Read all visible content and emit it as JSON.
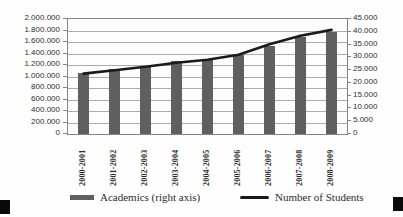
{
  "figure": {
    "background": "#fefefe"
  },
  "colors": {
    "bar": "#5f5f5f",
    "line": "#1a1a1a",
    "gridline": "#ababab",
    "axis": "#858585",
    "text": "#2e2e2e",
    "corner_mark": "#0a0a0a"
  },
  "chart_data": {
    "type": "bar",
    "subtype": "combo-bar-line-dual-axis",
    "title": "",
    "xlabel": "",
    "ylabel_left": "",
    "ylabel_right": "",
    "grid": true,
    "legend_position": "bottom",
    "categories": [
      "2000-2001",
      "2001-2002",
      "2002-2003",
      "2003-2004",
      "2004-2005",
      "2005-2006",
      "2006-2007",
      "2007-2008",
      "2008-2009"
    ],
    "series": [
      {
        "name": "Academics (right axis)",
        "type": "bar",
        "axis": "right",
        "values": [
          24000,
          25300,
          26600,
          28500,
          29200,
          31000,
          34400,
          38100,
          40000
        ]
      },
      {
        "name": "Number of Students",
        "type": "line",
        "axis": "left",
        "values": [
          1050000,
          1110000,
          1170000,
          1240000,
          1290000,
          1380000,
          1560000,
          1710000,
          1810000
        ]
      }
    ],
    "left_axis": {
      "min": 0,
      "max": 2000000,
      "step": 200000,
      "tick_labels": [
        "2.000.000",
        "1.800.000",
        "1.600.000",
        "1.400.000",
        "1.200.000",
        "1.000.000",
        "800.000",
        "600.000",
        "400.000",
        "200.000",
        "0"
      ]
    },
    "right_axis": {
      "min": 0,
      "max": 45000,
      "step": 5000,
      "tick_labels": [
        "45.000",
        "40.000",
        "35.000",
        "30.000",
        "25.000",
        "20.000",
        "15.000",
        "10.000",
        "5.000",
        "0"
      ]
    }
  },
  "legend": {
    "items": [
      {
        "label": "Academics (right axis)",
        "marker": "bar-swatch"
      },
      {
        "label": "Number of Students",
        "marker": "line-swatch"
      }
    ]
  }
}
